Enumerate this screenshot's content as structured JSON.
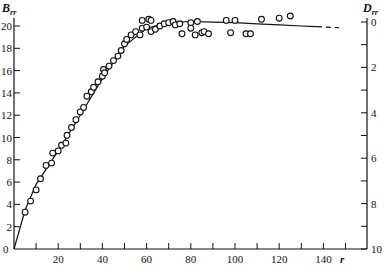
{
  "chart_data": {
    "type": "scatter",
    "title": "",
    "xlabel": "r",
    "ylabel": "B_rr",
    "y2label": "D_rr",
    "xlim": [
      0,
      150
    ],
    "ylim": [
      0,
      20
    ],
    "y2lim": [
      10,
      0
    ],
    "x_ticks": [
      10,
      20,
      30,
      40,
      50,
      60,
      70,
      80,
      90,
      100,
      110,
      120,
      130,
      140,
      150
    ],
    "x_tick_labels": [
      "20",
      "40",
      "60",
      "80",
      "100",
      "120",
      "140"
    ],
    "x_tick_label_values": [
      20,
      40,
      60,
      80,
      100,
      120,
      140
    ],
    "y_ticks": [
      0,
      2,
      4,
      6,
      8,
      10,
      12,
      14,
      16,
      18,
      20
    ],
    "y_tick_labels": [
      "0",
      "2",
      "4",
      "6",
      "8",
      "10",
      "12",
      "14",
      "16",
      "18",
      "20"
    ],
    "y2_ticks": [
      0,
      1,
      2,
      3,
      4,
      5,
      6,
      7,
      8,
      9,
      10
    ],
    "y2_tick_labels": [
      "0",
      "2",
      "4",
      "6",
      "8",
      "10"
    ],
    "y2_tick_label_values": [
      0,
      2,
      4,
      6,
      8,
      10
    ],
    "grid": false,
    "legend": null,
    "series": [
      {
        "name": "measured",
        "kind": "scatter",
        "marker": "open-circle",
        "x": [
          5,
          7.5,
          10,
          12,
          14.5,
          17,
          17.5,
          20,
          21.5,
          23.5,
          24,
          26,
          28,
          30,
          31.5,
          33,
          35,
          36,
          38,
          40,
          40.5,
          41,
          43,
          45,
          47,
          48.5,
          50,
          51,
          53,
          55,
          57,
          58,
          58,
          60,
          61,
          62,
          62,
          64,
          66,
          68,
          70,
          72,
          73,
          75,
          76,
          80,
          80,
          82,
          83,
          85,
          86,
          88,
          96,
          98,
          100,
          105,
          107,
          112,
          120,
          125
        ],
        "y": [
          3.3,
          4.3,
          5.3,
          6.3,
          7.5,
          7.7,
          8.6,
          8.8,
          9.3,
          9.5,
          10.2,
          10.9,
          11.6,
          12.3,
          12.7,
          13.7,
          14.1,
          14.5,
          15.0,
          15.5,
          16.1,
          15.8,
          16.4,
          16.9,
          17.3,
          17.8,
          18.4,
          18.8,
          19.2,
          19.5,
          19.2,
          19.8,
          20.5,
          19.9,
          20.6,
          19.5,
          20.5,
          19.7,
          20.0,
          20.2,
          20.3,
          20.4,
          20.1,
          20.2,
          19.3,
          20.3,
          19.8,
          19.2,
          20.4,
          19.4,
          19.5,
          19.3,
          20.5,
          19.4,
          20.5,
          19.3,
          19.3,
          20.6,
          20.7,
          20.9
        ]
      },
      {
        "name": "fitted curve",
        "kind": "line",
        "x": [
          0,
          5,
          10,
          20,
          30,
          40,
          50,
          60,
          70,
          80,
          90,
          100,
          110,
          120,
          130,
          137
        ],
        "y": [
          0,
          3.5,
          5.8,
          8.8,
          12.0,
          15.3,
          18.2,
          19.8,
          20.3,
          20.4,
          20.35,
          20.3,
          20.2,
          20.1,
          20.0,
          19.95
        ]
      },
      {
        "name": "extrapolation",
        "kind": "line",
        "style": "dashed",
        "x": [
          137,
          147
        ],
        "y": [
          19.95,
          19.85
        ]
      }
    ]
  },
  "axes": {
    "left_title": "B",
    "left_title_sub": "rr",
    "right_title": "D",
    "right_title_sub": "rr",
    "x_title": "r"
  },
  "colors": {
    "ink": "#111111",
    "background": "#ffffff"
  }
}
